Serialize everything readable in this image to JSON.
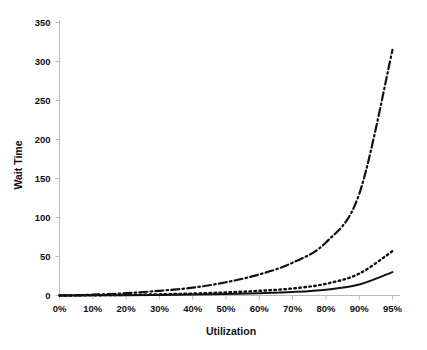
{
  "chart_data": {
    "type": "line",
    "title": "",
    "xlabel": "Utilization",
    "ylabel": "Wait Time",
    "categories": [
      "0%",
      "10%",
      "20%",
      "30%",
      "40%",
      "50%",
      "60%",
      "70%",
      "80%",
      "90%",
      "95%"
    ],
    "x": [
      0,
      10,
      20,
      30,
      40,
      50,
      60,
      70,
      80,
      90,
      95
    ],
    "ylim": [
      0,
      350
    ],
    "yticks": [
      0,
      50,
      100,
      150,
      200,
      250,
      300,
      350
    ],
    "ytick_labels": [
      "0",
      "50",
      "100",
      "150",
      "200",
      "250",
      "300",
      "350"
    ],
    "grid": false,
    "legend": "none",
    "axis_spines": [
      "left",
      "bottom"
    ],
    "series": [
      {
        "name": "high-variability",
        "style": "dash-dot",
        "values": [
          0,
          1,
          3,
          6,
          10,
          17,
          27,
          42,
          68,
          130,
          315
        ]
      },
      {
        "name": "medium-variability",
        "style": "dotted",
        "values": [
          0,
          0.3,
          0.8,
          1.5,
          2.5,
          4,
          6,
          9,
          15,
          28,
          57
        ]
      },
      {
        "name": "low-variability",
        "style": "solid",
        "values": [
          0,
          0.2,
          0.4,
          0.8,
          1.3,
          2,
          3,
          4.5,
          7.5,
          14,
          30
        ]
      }
    ]
  },
  "axes": {
    "x_title": "Utilization",
    "y_title": "Wait Time"
  }
}
